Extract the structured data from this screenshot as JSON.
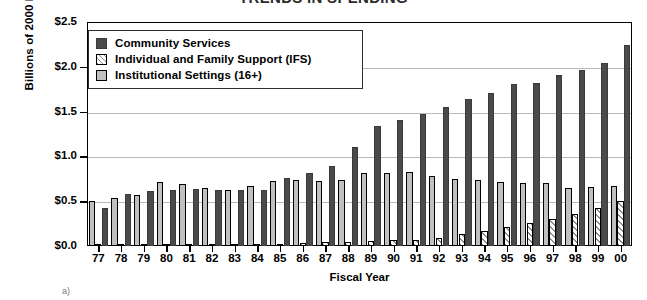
{
  "chart_data": {
    "type": "bar",
    "title": "TRENDS IN SPENDING",
    "xlabel": "Fiscal Year",
    "ylabel": "Billions of 2000 Dollars",
    "ylim": [
      0.0,
      2.5
    ],
    "ytick_labels": [
      "$0.0",
      "$0.5",
      "$1.0",
      "$1.5",
      "$2.0",
      "$2.5"
    ],
    "ytick_values": [
      0.0,
      0.5,
      1.0,
      1.5,
      2.0,
      2.5
    ],
    "grid": true,
    "legend_position": "upper-left-inside",
    "categories": [
      "77",
      "78",
      "79",
      "80",
      "81",
      "82",
      "83",
      "84",
      "85",
      "86",
      "87",
      "88",
      "89",
      "90",
      "91",
      "92",
      "93",
      "94",
      "95",
      "96",
      "97",
      "98",
      "99",
      "00"
    ],
    "series": [
      {
        "name": "Institutional Settings (16+)",
        "color": "#c0c0c0",
        "values": [
          0.5,
          0.54,
          0.57,
          0.71,
          0.69,
          0.65,
          0.63,
          0.67,
          0.73,
          0.74,
          0.73,
          0.74,
          0.81,
          0.82,
          0.83,
          0.78,
          0.75,
          0.74,
          0.72,
          0.7,
          0.7,
          0.65,
          0.66,
          0.67
        ]
      },
      {
        "name": "Individual and Family Support (IFS)",
        "color": "#8d8d8d",
        "values": [
          0.01,
          0.01,
          0.01,
          0.01,
          0.01,
          0.01,
          0.01,
          0.02,
          0.02,
          0.03,
          0.04,
          0.05,
          0.06,
          0.07,
          0.07,
          0.09,
          0.13,
          0.17,
          0.21,
          0.26,
          0.3,
          0.36,
          0.42,
          0.5
        ]
      },
      {
        "name": "Community Services",
        "color": "#4a4a4a",
        "values": [
          0.42,
          0.58,
          0.61,
          0.62,
          0.64,
          0.62,
          0.62,
          0.63,
          0.76,
          0.81,
          0.89,
          1.11,
          1.34,
          1.41,
          1.47,
          1.55,
          1.64,
          1.71,
          1.81,
          1.82,
          1.91,
          1.97,
          2.04,
          2.24
        ]
      }
    ]
  },
  "legend": {
    "items": [
      {
        "label": "Community Services",
        "swatch": "swatch-dark-solid"
      },
      {
        "label": "Individual and Family Support (IFS)",
        "swatch": "swatch-hatched"
      },
      {
        "label": "Institutional Settings (16+)",
        "swatch": "swatch-light-gray"
      }
    ]
  },
  "footnote": {
    "mark": "a)"
  }
}
